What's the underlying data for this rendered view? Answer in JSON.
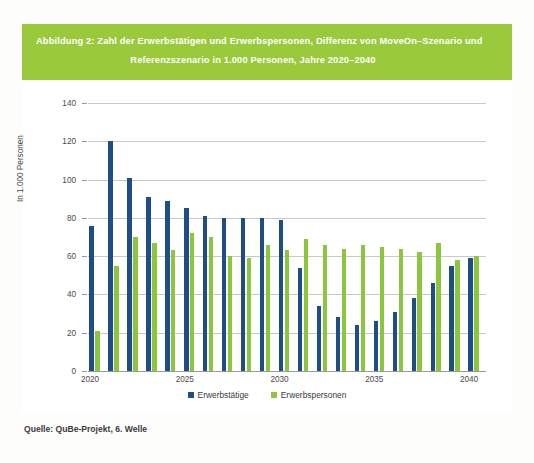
{
  "header": {
    "title_line1": "Abbildung 2: Zahl der Erwerbstätigen und Erwerbspersonen, Differenz von MoveOn–Szenario und",
    "title_line2": "Referenzszenario in 1.000 Personen, Jahre 2020–2040",
    "band_color": "#9ACA3C"
  },
  "source": "Quelle: QuBe-Projekt, 6. Welle",
  "legend": [
    {
      "label": "Erwerbstätige",
      "color": "#1F4E87"
    },
    {
      "label": "Erwerbspersonen",
      "color": "#8CC63F"
    }
  ],
  "chart_data": {
    "type": "bar",
    "title": "Abbildung 2: Zahl der Erwerbstätigen und Erwerbspersonen, Differenz von MoveOn–Szenario und Referenzszenario in 1.000 Personen, Jahre 2020–2040",
    "xlabel": "",
    "ylabel": "In 1.000 Personen",
    "ylim": [
      0,
      140
    ],
    "yticks": [
      0,
      20,
      40,
      60,
      80,
      100,
      120,
      140
    ],
    "xticks": [
      2020,
      2025,
      2030,
      2035,
      2040
    ],
    "grid": true,
    "legend_position": "bottom",
    "categories": [
      2020,
      2021,
      2022,
      2023,
      2024,
      2025,
      2026,
      2027,
      2028,
      2029,
      2030,
      2031,
      2032,
      2033,
      2034,
      2035,
      2036,
      2037,
      2038,
      2039,
      2040
    ],
    "series": [
      {
        "name": "Erwerbstätige",
        "color": "#1F4E87",
        "values": [
          76,
          120,
          101,
          91,
          89,
          85,
          81,
          80,
          80,
          80,
          79,
          54,
          34,
          28,
          24,
          26,
          31,
          38,
          46,
          55,
          59
        ]
      },
      {
        "name": "Erwerbspersonen",
        "color": "#8CC63F",
        "values": [
          21,
          55,
          70,
          67,
          63,
          72,
          70,
          60,
          59,
          66,
          63,
          69,
          66,
          64,
          66,
          65,
          64,
          62,
          67,
          58,
          60
        ]
      }
    ]
  }
}
